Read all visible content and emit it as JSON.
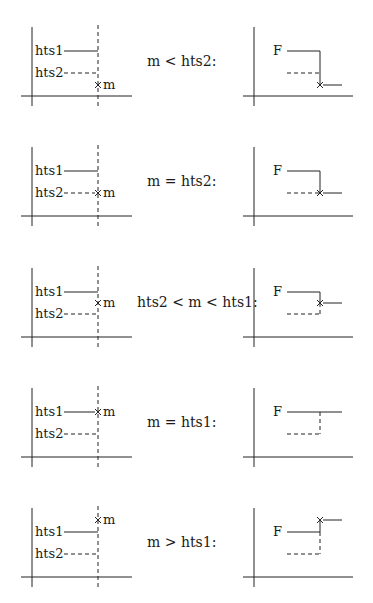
{
  "labels": {
    "threshold_high": "hts1",
    "threshold_low": "hts2",
    "measurement": "m",
    "function": "F"
  },
  "panels": [
    {
      "id": "m-below-hts2",
      "condition": "m < hts2:",
      "m_level": "below_hts2",
      "output_level": "low_beyond"
    },
    {
      "id": "m-equals-hts2",
      "condition": "m = hts2:",
      "m_level": "at_hts2",
      "output_level": "at_hts2"
    },
    {
      "id": "m-between",
      "condition": "hts2 < m < hts1:",
      "m_level": "between",
      "output_level": "between"
    },
    {
      "id": "m-equals-hts1",
      "condition": "m = hts1:",
      "m_level": "at_hts1",
      "output_level": "at_hts1"
    },
    {
      "id": "m-above-hts1",
      "condition": "m > hts1:",
      "m_level": "above_hts1",
      "output_level": "above_hts1"
    }
  ]
}
